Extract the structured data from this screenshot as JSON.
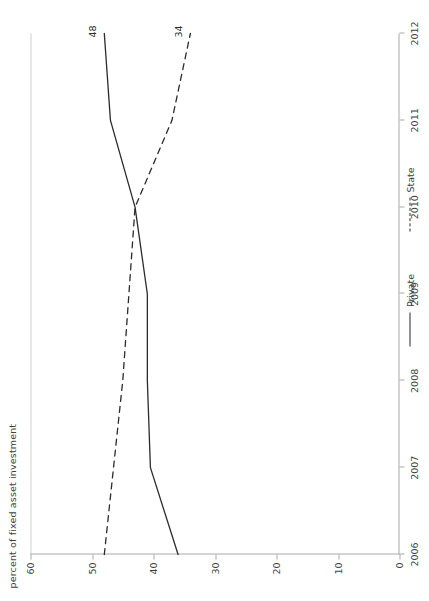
{
  "chart_data": {
    "type": "line",
    "title": "",
    "subtitle": "",
    "xlabel": "",
    "ylabel": "percent of fixed asset investment",
    "x": [
      2006,
      2007,
      2008,
      2009,
      2010,
      2011,
      2012
    ],
    "categories": [
      "2006",
      "2007",
      "2008",
      "2009",
      "2010",
      "2011",
      "2012"
    ],
    "xlim": [
      2006,
      2012
    ],
    "ylim": [
      0,
      60
    ],
    "yticks": [
      0,
      10,
      20,
      30,
      40,
      50,
      60
    ],
    "yticklabels": [
      "0",
      "10",
      "20",
      "30",
      "40",
      "50",
      "60"
    ],
    "xticklabels": [
      "2006",
      "2007",
      "2008",
      "2009",
      "2010",
      "2011",
      "2012"
    ],
    "grid": false,
    "legend_position": "bottom",
    "orientation": "rotated-90",
    "series": [
      {
        "name": "Private",
        "style": "solid",
        "color": "#2b2b2b",
        "values": [
          36,
          40.5,
          41,
          41,
          43,
          47,
          48
        ],
        "end_label": "48"
      },
      {
        "name": "State",
        "style": "dashed",
        "color": "#2b2b2b",
        "values": [
          48,
          46.5,
          45,
          44,
          43,
          37,
          34
        ],
        "end_label": "34"
      }
    ],
    "annotations": [
      {
        "text": "48",
        "series": "Private",
        "x": 2012,
        "y": 48
      },
      {
        "text": "34",
        "series": "State",
        "x": 2012,
        "y": 34
      }
    ]
  },
  "legend": {
    "items": [
      {
        "label": "Private",
        "style": "solid"
      },
      {
        "label": "State",
        "style": "dashed"
      }
    ]
  }
}
